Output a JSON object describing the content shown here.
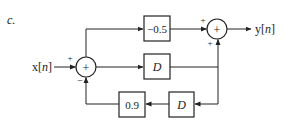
{
  "diagram": {
    "label": "c.",
    "input": "x[n]",
    "output": "y[n]",
    "blocks": {
      "gain_top": "−0.5",
      "delay_mid": "D",
      "gain_feedback": "0.9",
      "delay_feedback": "D"
    },
    "summer1": {
      "symbol": "+",
      "sign_input": "+",
      "sign_feedback": "−"
    },
    "summer2": {
      "symbol": "+",
      "sign_top": "+",
      "sign_bottom": "+"
    },
    "colors": {
      "stroke": "#222222",
      "background": "#ffffff"
    }
  }
}
